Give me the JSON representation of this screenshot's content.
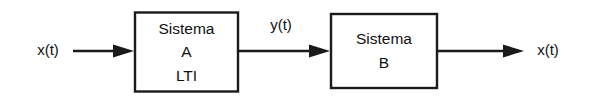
{
  "diagram": {
    "type": "block-diagram",
    "background_color": "#ffffff",
    "line_color": "#1a1a1a",
    "text_color": "#111111",
    "blocks": [
      {
        "id": "system-a",
        "lines": [
          "Sistema",
          "A",
          "LTI"
        ],
        "line1": "Sistema",
        "line2": "A",
        "line3": "LTI"
      },
      {
        "id": "system-b",
        "lines": [
          "Sistema",
          "B"
        ],
        "line1": "Sistema",
        "line2": "B"
      }
    ],
    "signals": {
      "input": "x(t)",
      "intermediate": "y(t)",
      "output": "x(t)"
    }
  }
}
